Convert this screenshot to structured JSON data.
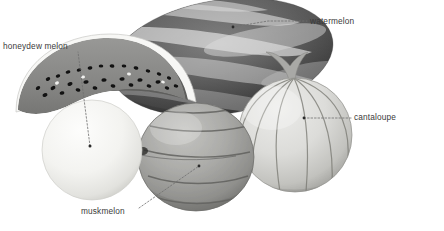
{
  "figure": {
    "kind": "labeled-photograph-diagram",
    "background_color": "#ffffff",
    "width": 444,
    "height": 231,
    "label_color": "#3a3a3a",
    "leader_color": "#7a7a7a"
  },
  "labels": {
    "watermelon": "watermelon",
    "cantaloupe": "cantaloupe",
    "honeydew": "honeydew melon",
    "muskmelon": "muskmelon"
  },
  "watermark": {
    "text": ""
  },
  "objects": {
    "watermelon_whole": {
      "name": "watermelon",
      "shape": "oblong ellipse",
      "center": [
        222,
        57
      ],
      "rx": 112,
      "ry": 57,
      "rotation_deg": -9,
      "fill_dark": "#4a4a4a",
      "fill_light": "#b9b9b9",
      "stripes": 7
    },
    "watermelon_slice": {
      "name": "watermelon slice",
      "shape": "crescent wedge",
      "center": [
        90,
        95
      ],
      "rind_color": "#f2f2f2",
      "flesh_color": "#8e8e8e",
      "seed_color": "#1b1b1b",
      "seed_count": 34
    },
    "honeydew": {
      "name": "honeydew melon",
      "shape": "sphere",
      "center": [
        92,
        150
      ],
      "r": 50,
      "fill": "#f4f4f2",
      "shade": "#d7d7d4"
    },
    "muskmelon": {
      "name": "muskmelon",
      "shape": "ribbed oval",
      "center": [
        196,
        157
      ],
      "rx": 58,
      "ry": 54,
      "fill": "#a9a9a7",
      "rib_color": "#6d6d6b",
      "ribs": 5
    },
    "cantaloupe": {
      "name": "cantaloupe",
      "shape": "ribbed sphere with stem",
      "center": [
        295,
        135
      ],
      "r": 57,
      "fill": "#d9d9d6",
      "rib_color": "#7d7d7a",
      "ribs": 6,
      "stem_color": "#a5a5a2"
    }
  },
  "leaders": [
    {
      "name": "watermelon",
      "dot": [
        233,
        27
      ],
      "elbow": [
        268,
        21
      ],
      "end": [
        307,
        21
      ]
    },
    {
      "name": "cantaloupe",
      "dot": [
        304,
        118
      ],
      "elbow": [
        330,
        118
      ],
      "end": [
        352,
        118
      ]
    },
    {
      "name": "honeydew",
      "dot": [
        90,
        146
      ],
      "elbow": [
        80,
        70
      ],
      "end": [
        78,
        52
      ]
    },
    {
      "name": "muskmelon",
      "dot": [
        199,
        166
      ],
      "elbow": [
        160,
        196
      ],
      "end": [
        139,
        208
      ]
    }
  ]
}
